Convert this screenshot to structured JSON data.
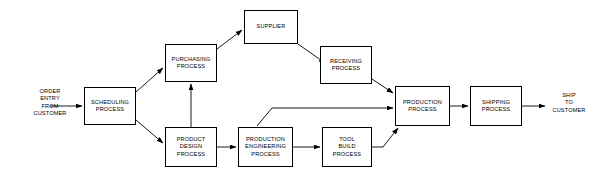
{
  "diagram": {
    "type": "flowchart",
    "background_color": "#ffffff",
    "line_color": "#000000",
    "text_color": "#000000",
    "nodes": [
      {
        "id": "order-entry",
        "label": "ORDER\nENTRY\nFROM\nCUSTOMER",
        "shape": "text",
        "x": 22,
        "y": 88,
        "w": 56,
        "h": 36
      },
      {
        "id": "scheduling-process",
        "label": "SCHEDULING\nPROCESS",
        "shape": "box",
        "x": 84,
        "y": 87,
        "w": 52,
        "h": 38
      },
      {
        "id": "purchasing-process",
        "label": "PURCHASING\nPROCESS",
        "shape": "box",
        "x": 165,
        "y": 44,
        "w": 52,
        "h": 38
      },
      {
        "id": "supplier",
        "label": "SUPPLIER",
        "shape": "box",
        "x": 244,
        "y": 10,
        "w": 54,
        "h": 34
      },
      {
        "id": "receiving-process",
        "label": "RECEIVING\nPROCESS",
        "shape": "box",
        "x": 320,
        "y": 46,
        "w": 52,
        "h": 38
      },
      {
        "id": "product-design-process",
        "label": "PRODUCT\nDESIGN\nPROCESS",
        "shape": "box",
        "x": 165,
        "y": 127,
        "w": 52,
        "h": 40
      },
      {
        "id": "production-engineering-process",
        "label": "PRODUCTION\nENGINEERING\nPROCESS",
        "shape": "box",
        "x": 238,
        "y": 127,
        "w": 55,
        "h": 40
      },
      {
        "id": "tool-build-process",
        "label": "TOOL\nBUILD\nPROCESS",
        "shape": "box",
        "x": 322,
        "y": 127,
        "w": 50,
        "h": 40
      },
      {
        "id": "production-process",
        "label": "PRODUCTION\nPROCESS",
        "shape": "box",
        "x": 395,
        "y": 86,
        "w": 55,
        "h": 40
      },
      {
        "id": "shipping-process",
        "label": "SHIPPING\nPROCESS",
        "shape": "box",
        "x": 470,
        "y": 86,
        "w": 52,
        "h": 40
      },
      {
        "id": "ship-to-customer",
        "label": "SHIP\nTO\nCUSTOMER",
        "shape": "text",
        "x": 543,
        "y": 92,
        "w": 52,
        "h": 28
      }
    ],
    "edges": [
      {
        "id": "edge-order-to-scheduling",
        "from": "order-entry",
        "to": "scheduling-process",
        "path": "M50,106 L82,106"
      },
      {
        "id": "edge-scheduling-to-purchasing",
        "from": "scheduling-process",
        "to": "purchasing-process",
        "path": "M136,92 L163,68"
      },
      {
        "id": "edge-scheduling-to-product-design",
        "from": "scheduling-process",
        "to": "product-design-process",
        "path": "M136,120 L163,143"
      },
      {
        "id": "edge-purchasing-to-supplier",
        "from": "purchasing-process",
        "to": "supplier",
        "path": "M217,49 L242,30"
      },
      {
        "id": "edge-supplier-to-receiving",
        "from": "supplier",
        "to": "receiving-process",
        "path": "M298,44 L325,63"
      },
      {
        "id": "edge-receiving-to-production",
        "from": "receiving-process",
        "to": "production-process",
        "path": "M372,79 L393,93"
      },
      {
        "id": "edge-product-design-to-purchasing",
        "from": "product-design-process",
        "to": "purchasing-process",
        "path": "M191,127 L191,84"
      },
      {
        "id": "edge-product-design-to-production-engineering",
        "from": "product-design-process",
        "to": "production-engineering-process",
        "path": "M217,147 L236,147"
      },
      {
        "id": "edge-production-engineering-to-tool-build",
        "from": "production-engineering-process",
        "to": "tool-build-process",
        "path": "M293,147 L320,147"
      },
      {
        "id": "edge-production-engineering-to-production",
        "from": "production-engineering-process",
        "to": "production-process",
        "path": "M257,126 L272,108 L393,108"
      },
      {
        "id": "edge-tool-build-to-production",
        "from": "tool-build-process",
        "to": "production-process",
        "path": "M372,147 L383,147 L383,147 L398,128"
      },
      {
        "id": "edge-production-to-shipping",
        "from": "production-process",
        "to": "shipping-process",
        "path": "M450,106 L468,106"
      },
      {
        "id": "edge-shipping-to-ship-customer",
        "from": "shipping-process",
        "to": "ship-to-customer",
        "path": "M522,106 L545,106"
      }
    ]
  }
}
